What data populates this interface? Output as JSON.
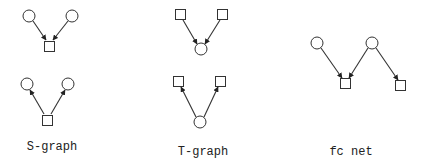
{
  "diagrams": [
    {
      "label": "S-graph",
      "label_pos": [
        52,
        150
      ],
      "subgraphs": [
        {
          "places": [
            [
              29,
              16
            ],
            [
              72,
              16
            ]
          ],
          "transitions": [
            [
              49.5,
              46.5
            ]
          ],
          "arcs": [
            {
              "from": [
                33,
                21
              ],
              "to": [
                46,
                40
              ]
            },
            {
              "from": [
                68,
                21
              ],
              "to": [
                53,
                40
              ]
            }
          ]
        },
        {
          "places": [
            [
              27,
              84
            ],
            [
              68,
              84
            ]
          ],
          "transitions": [
            [
              47.5,
              120.5
            ]
          ],
          "arcs": [
            {
              "from": [
                44,
                114
              ],
              "to": [
                30,
                90
              ]
            },
            {
              "from": [
                51,
                114
              ],
              "to": [
                65,
                90
              ]
            }
          ]
        }
      ]
    },
    {
      "label": "T-graph",
      "label_pos": [
        203,
        155
      ],
      "subgraphs": [
        {
          "places": [
            [
              201,
              49
            ]
          ],
          "transitions": [
            [
              180.5,
              14.5
            ],
            [
              222.5,
              14.5
            ]
          ],
          "arcs": [
            {
              "from": [
                183,
                20
              ],
              "to": [
                197,
                44
              ]
            },
            {
              "from": [
                220,
                20
              ],
              "to": [
                205,
                44
              ]
            }
          ]
        },
        {
          "places": [
            [
              200,
              122
            ]
          ],
          "transitions": [
            [
              178.5,
              81.5
            ],
            [
              220.5,
              81.5
            ]
          ],
          "arcs": [
            {
              "from": [
                196,
                117
              ],
              "to": [
                181,
                87
              ]
            },
            {
              "from": [
                204,
                117
              ],
              "to": [
                218,
                87
              ]
            }
          ]
        }
      ]
    },
    {
      "label": "fc net",
      "label_pos": [
        351,
        155
      ],
      "subgraphs": [
        {
          "places": [
            [
              317,
              43
            ],
            [
              372,
              43
            ]
          ],
          "transitions": [
            [
              345.5,
              83.5
            ],
            [
              400.5,
              85.5
            ]
          ],
          "arcs": [
            {
              "from": [
                321,
                48
              ],
              "to": [
                342,
                78
              ]
            },
            {
              "from": [
                368,
                48
              ],
              "to": [
                349,
                78
              ]
            },
            {
              "from": [
                376,
                48
              ],
              "to": [
                398,
                80
              ]
            }
          ]
        }
      ]
    }
  ],
  "style": {
    "place_radius": 6,
    "transition_size": 10,
    "stroke": "#333333",
    "background": "#ffffff"
  }
}
